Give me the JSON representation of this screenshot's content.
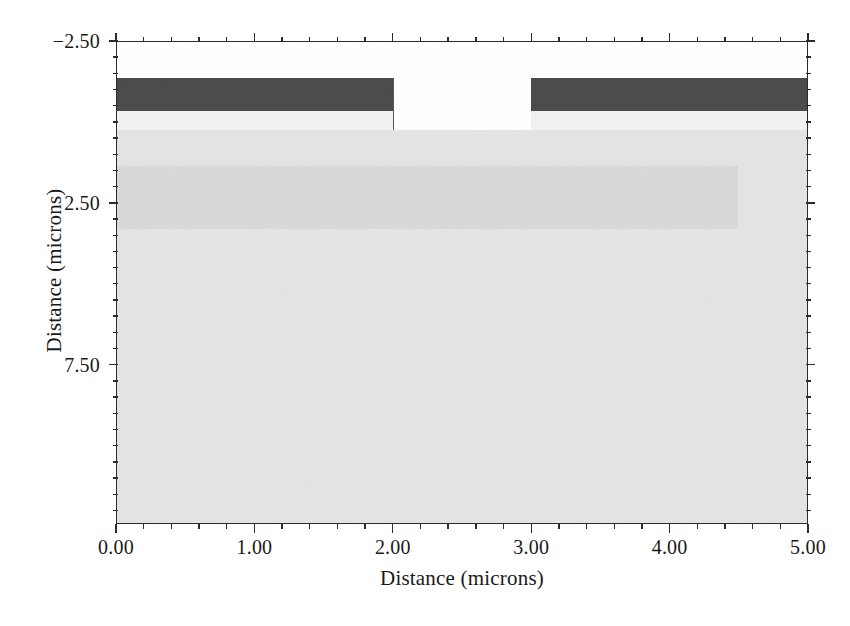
{
  "figure": {
    "title": "",
    "background": "#ffffff"
  },
  "axes": {
    "x_title": "Distance (microns)",
    "y_title": "Distance (microns)",
    "x_ticks": [
      "0.00",
      "1.00",
      "2.00",
      "3.00",
      "4.00",
      "5.00"
    ],
    "y_ticks": [
      "-2.50",
      "2.50",
      "7.50"
    ],
    "frame_color": "#2b2b2b"
  },
  "chart_data": {
    "type": "heatmap",
    "title": "",
    "xlabel": "Distance (microns)",
    "ylabel": "Distance (microns)",
    "xlim": [
      0.0,
      5.0
    ],
    "ylim": [
      12.42,
      -2.5
    ],
    "y_inverted": true,
    "grid": false,
    "legend": null,
    "x_tick_values": [
      0.0,
      1.0,
      2.0,
      3.0,
      4.0,
      5.0
    ],
    "x_tick_labels": [
      "0.00",
      "1.00",
      "2.00",
      "3.00",
      "4.00",
      "5.00"
    ],
    "x_minor_tick_step": 0.2,
    "y_tick_values": [
      -2.5,
      2.5,
      7.5
    ],
    "y_tick_labels": [
      "-2.50",
      "2.50",
      "7.50"
    ],
    "y_minor_tick_step": 0.5,
    "regions": [
      {
        "name": "air",
        "color": "#ffffff",
        "x_range": [
          0.0,
          5.0
        ],
        "y_range": [
          -2.5,
          12.42
        ]
      },
      {
        "name": "metal-electrode-left",
        "color": "#4a4a4a",
        "x_range": [
          0.0,
          2.0
        ],
        "y_range": [
          -1.39,
          -0.36
        ]
      },
      {
        "name": "metal-electrode-right",
        "color": "#4a4a4a",
        "x_range": [
          3.0,
          5.0
        ],
        "y_range": [
          -1.39,
          -0.36
        ]
      },
      {
        "name": "oxide-layer-left",
        "color": "#f2f2f2",
        "x_range": [
          0.0,
          2.0
        ],
        "y_range": [
          -0.36,
          0.24
        ]
      },
      {
        "name": "oxide-layer-right",
        "color": "#f2f2f2",
        "x_range": [
          3.0,
          5.0
        ],
        "y_range": [
          -0.36,
          0.24
        ]
      },
      {
        "name": "substrate",
        "color": "#e4e4e4",
        "x_range": [
          0.0,
          5.0
        ],
        "y_range": [
          0.24,
          12.42
        ]
      },
      {
        "name": "doped-band",
        "color": "#d9d9d9",
        "x_range": [
          0.0,
          4.5
        ],
        "y_range": [
          1.35,
          3.3
        ]
      },
      {
        "name": "trench-sidewall-line",
        "color": "#555555",
        "x_range": [
          2.0,
          2.01
        ],
        "y_range": [
          -1.39,
          0.24
        ]
      }
    ]
  }
}
